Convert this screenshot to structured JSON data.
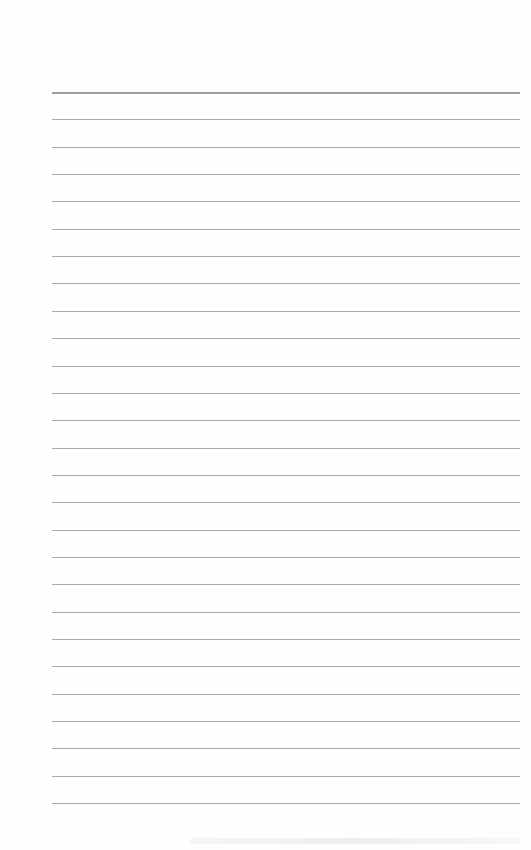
{
  "page": {
    "type": "blank lined paper",
    "background_color": "#fefefe",
    "rule_color": "#9a9a9a",
    "rule_count": 27,
    "first_rule_y": 92,
    "rule_spacing": 27.35,
    "rule_left": 52,
    "rule_right": 520,
    "text": ""
  }
}
